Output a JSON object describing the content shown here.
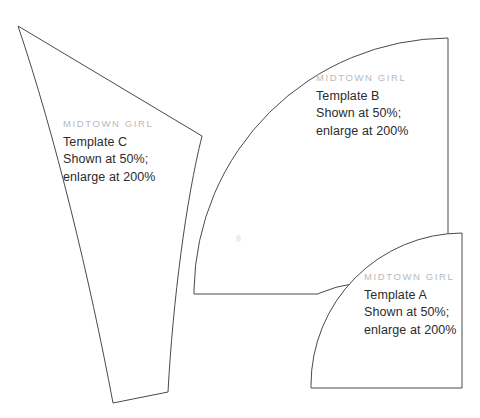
{
  "page": {
    "width": 480,
    "height": 418,
    "background": "#ffffff",
    "stroke_color": "#4a4a4f",
    "brand_color": "#b9b9bd",
    "text_color": "#2b2b2e"
  },
  "templates": [
    {
      "id": "c",
      "brand": "MIDTOWN GIRL",
      "name": "Template C",
      "scale_note": "Shown at 50%;",
      "enlarge_note": "enlarge at 200%",
      "shape": "curved-wedge",
      "path": "M 18 26 L 202 136 C 186 200 173 300 168 392 L 113 403 C 90 280 55 135 18 26 Z"
    },
    {
      "id": "b",
      "brand": "MIDTOWN GIRL",
      "name": "Template B",
      "scale_note": "Shown at 50%;",
      "enlarge_note": "enlarge at 200%",
      "shape": "quarter-annulus",
      "path": "M 194 294 L 194 290 A 256 256 0 0 1 448 38 L 448 309 A 127 127 0 0 0 320 293 L 318 294 Z"
    },
    {
      "id": "a",
      "brand": "MIDTOWN GIRL",
      "name": "Template A",
      "scale_note": "Shown at 50%;",
      "enlarge_note": "enlarge at 200%",
      "shape": "quarter-circle",
      "path": "M 311 388 L 311 385 A 152 152 0 0 1 462 233 L 462 388 Z"
    }
  ],
  "marks": {
    "speck_label": "paper-speck"
  }
}
